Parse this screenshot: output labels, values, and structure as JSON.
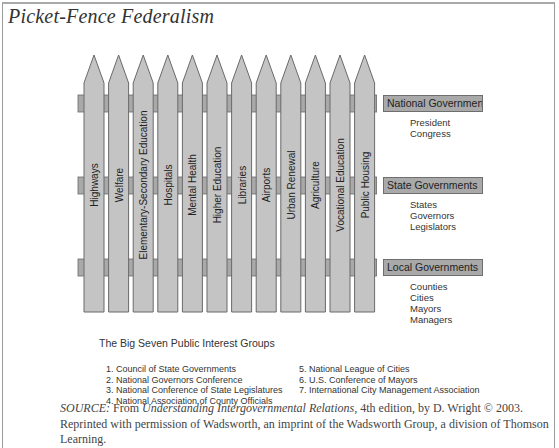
{
  "title": "Picket-Fence Federalism",
  "pickets": [
    {
      "label": "Highways"
    },
    {
      "label": "Welfare"
    },
    {
      "label": "Elementary-Secondary Education"
    },
    {
      "label": "Hospitals"
    },
    {
      "label": "Mental Health"
    },
    {
      "label": "Higher Education"
    },
    {
      "label": "Libraries"
    },
    {
      "label": "Airports"
    },
    {
      "label": "Urban Renewal"
    },
    {
      "label": "Agriculture"
    },
    {
      "label": "Vocational Education"
    },
    {
      "label": "Public Housing"
    }
  ],
  "rails": [
    {
      "label": "National Government",
      "members": [
        "President",
        "Congress"
      ]
    },
    {
      "label": "State Governments",
      "members": [
        "States",
        "Governors",
        "Legislators"
      ]
    },
    {
      "label": "Local Governments",
      "members": [
        "Counties",
        "Cities",
        "Mayors",
        "Managers"
      ]
    }
  ],
  "big_seven": {
    "heading": "The Big Seven Public Interest Groups",
    "left": [
      "1. Council of State Governments",
      "2. National Governors Conference",
      "3. National Conference of State Legislatures",
      "4. National Association of County Officials"
    ],
    "right": [
      "5. National League of Cities",
      "6. U.S. Conference of Mayors",
      "7. International City Management Association"
    ]
  },
  "source": {
    "prefix": "SOURCE:",
    "from": " From ",
    "book": "Understanding Intergovernmental Relations",
    "rest": ", 4th edition, by D. Wright © 2003. Reprinted with permission of Wadsworth, an imprint of the Wadsworth Group, a division of Thomson Learning."
  },
  "colors": {
    "picket_fill": "#c4c4c4",
    "picket_stroke": "#6a6a6a",
    "rail_fill": "#a9a9a9"
  }
}
